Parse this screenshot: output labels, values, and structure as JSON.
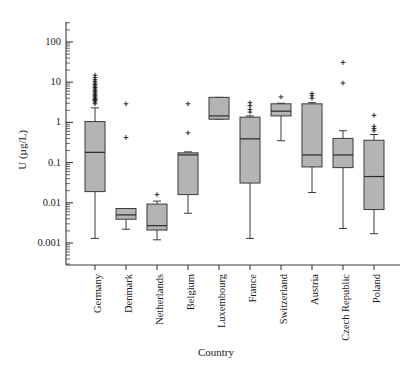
{
  "figure": {
    "background_color": "#ffffff",
    "box_fill_color": "#b4b4b4",
    "line_color": "#3a3a3a"
  },
  "chart_data": {
    "type": "box",
    "title": "",
    "xlabel": "Country",
    "ylabel": "U (µg/L)",
    "yscale": "log",
    "ylim": [
      0.0004,
      300
    ],
    "grid": false,
    "legend": "none",
    "ytick_labels": [
      "100",
      "10",
      "1",
      "0.1",
      "0.01",
      "0.001"
    ],
    "ytick_values": [
      100,
      10,
      1,
      0.1,
      0.01,
      0.001
    ],
    "categories": [
      "Germany",
      "Denmark",
      "Netherlands",
      "Belgium",
      "Luxembourg",
      "France",
      "Switzerland",
      "Austria",
      "Czech Republic",
      "Poland"
    ],
    "boxes": [
      {
        "category": "Germany",
        "whisker_low": 0.0013,
        "q1": 0.019,
        "median": 0.18,
        "q3": 1.05,
        "whisker_high": 2.3,
        "outliers": [
          2.9,
          3.2,
          3.5,
          3.6,
          3.8,
          4.0,
          4.3,
          4.6,
          5.0,
          5.4,
          5.8,
          6.3,
          6.8,
          7.4,
          8.0,
          8.7,
          9.5,
          10.5,
          11.5,
          13.0,
          15.0
        ]
      },
      {
        "category": "Denmark",
        "whisker_low": 0.0022,
        "q1": 0.0039,
        "median": 0.005,
        "q3": 0.0072,
        "whisker_high": 0.0072,
        "outliers": [
          0.42,
          2.9
        ]
      },
      {
        "category": "Netherlands",
        "whisker_low": 0.0012,
        "q1": 0.0021,
        "median": 0.0027,
        "q3": 0.0093,
        "whisker_high": 0.011,
        "outliers": [
          0.016
        ]
      },
      {
        "category": "Belgium",
        "whisker_low": 0.0055,
        "q1": 0.016,
        "median": 0.155,
        "q3": 0.175,
        "whisker_high": 0.185,
        "outliers": [
          0.55,
          2.9
        ]
      },
      {
        "category": "Luxembourg",
        "whisker_low": 1.2,
        "q1": 1.2,
        "median": 1.45,
        "q3": 4.2,
        "whisker_high": 4.2,
        "outliers": []
      },
      {
        "category": "France",
        "whisker_low": 0.0013,
        "q1": 0.031,
        "median": 0.39,
        "q3": 1.35,
        "whisker_high": 1.45,
        "outliers": [
          1.8,
          2.1,
          2.6,
          3.1
        ]
      },
      {
        "category": "Switzerland",
        "whisker_low": 0.35,
        "q1": 1.45,
        "median": 1.9,
        "q3": 2.9,
        "whisker_high": 3.0,
        "outliers": [
          4.3
        ]
      },
      {
        "category": "Austria",
        "whisker_low": 0.018,
        "q1": 0.078,
        "median": 0.155,
        "q3": 2.9,
        "whisker_high": 3.1,
        "outliers": [
          4.0,
          4.6,
          5.2
        ]
      },
      {
        "category": "Czech Republic",
        "whisker_low": 0.0023,
        "q1": 0.075,
        "median": 0.155,
        "q3": 0.4,
        "whisker_high": 0.62,
        "outliers": [
          9.5,
          31.0
        ]
      },
      {
        "category": "Poland",
        "whisker_low": 0.0017,
        "q1": 0.0068,
        "median": 0.045,
        "q3": 0.36,
        "whisker_high": 0.5,
        "outliers": [
          0.62,
          0.7,
          0.8,
          1.5
        ]
      }
    ]
  }
}
